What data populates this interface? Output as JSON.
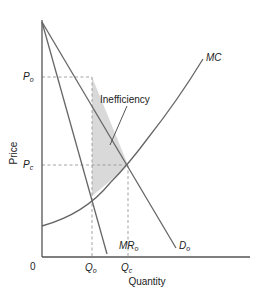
{
  "diagram": {
    "axes": {
      "x_label": "Quantity",
      "y_label": "Price",
      "origin_label": "0"
    },
    "curves": {
      "mc": {
        "label": "MC"
      },
      "demand": {
        "label_main": "D",
        "label_sub": "o"
      },
      "marginal_revenue": {
        "label_main": "MR",
        "label_sub": "o"
      }
    },
    "price_levels": {
      "monopoly": {
        "label_main": "P",
        "label_sub": "o"
      },
      "competitive": {
        "label_main": "P",
        "label_sub": "c"
      }
    },
    "quantity_levels": {
      "monopoly": {
        "label_main": "Q",
        "label_sub": "o"
      },
      "competitive": {
        "label_main": "Q",
        "label_sub": "c"
      }
    },
    "annotation": {
      "inefficiency": "Inefficiency"
    },
    "colors": {
      "lines": "#666666",
      "axes": "#555555",
      "dashed": "#999999",
      "shade": "#d9d9d9",
      "text": "#222222"
    }
  }
}
